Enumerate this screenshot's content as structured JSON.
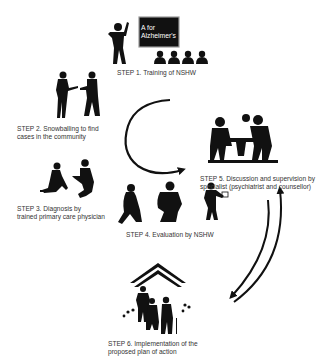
{
  "diagram": {
    "type": "cyclical-process",
    "ink_color": "#111111",
    "background": "#ffffff",
    "steps": [
      {
        "id": 1,
        "label": "STEP 1. Training of NSHW",
        "illustration": "teacher-with-blackboard-and-audience"
      },
      {
        "id": 2,
        "label_line1": "STEP 2. Snowballing to find",
        "label_line2": "cases in the community",
        "illustration": "two-people-talking"
      },
      {
        "id": 3,
        "label_line1": "STEP 3. Diagnosis by",
        "label_line2": "trained primary care physician",
        "illustration": "physician-with-seated-patient"
      },
      {
        "id": 4,
        "label": "STEP 4. Evaluation by NSHW",
        "illustration": "distressed-people-and-health-worker"
      },
      {
        "id": 5,
        "label_line1": "STEP 5. Discussion and supervision by",
        "label_line2": "specialist (psychiatrist and counsellor)",
        "illustration": "people-at-table"
      },
      {
        "id": 6,
        "label_line1": "STEP 6. Implementation of the",
        "label_line2": "proposed plan of action",
        "illustration": "family-walking-under-roof"
      }
    ],
    "blackboard": {
      "line1": "A for",
      "line2": "Alzheimer's"
    },
    "arrows": [
      {
        "from": "step-2/3 area",
        "to": "step-5",
        "shape": "curved-clockwise"
      },
      {
        "from": "step-5",
        "to": "step-6",
        "shape": "curved-down"
      },
      {
        "from": "step-6",
        "to": "step-5",
        "shape": "curved-up"
      }
    ]
  }
}
